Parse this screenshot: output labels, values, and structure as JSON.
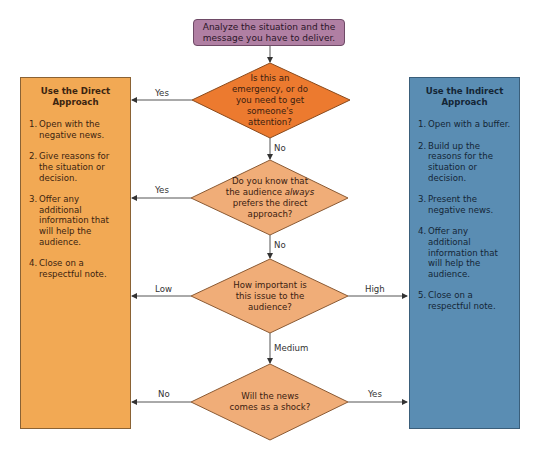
{
  "start": {
    "text": "Analyze the situation and the message you have to deliver."
  },
  "decisions": [
    {
      "id": "emergency",
      "lines": [
        "Is this an",
        "emergency, or do",
        "you need to get",
        "someone's",
        "attention?"
      ],
      "color": "#ec7a2f"
    },
    {
      "id": "always-direct",
      "lines_pre": "Do you know that",
      "line2_a": "the audience ",
      "line2_em": "always",
      "lines_post": [
        "prefers the direct",
        "approach?"
      ],
      "color": "#f0ad78"
    },
    {
      "id": "importance",
      "lines": [
        "How important is",
        "this issue to the",
        "audience?"
      ],
      "color": "#f0ad78"
    },
    {
      "id": "shock",
      "lines": [
        "Will the news",
        "comes as a shock?"
      ],
      "color": "#f0ad78"
    }
  ],
  "edges": {
    "d1_yes": "Yes",
    "d1_no": "No",
    "d2_yes": "Yes",
    "d2_no": "No",
    "d3_low": "Low",
    "d3_high": "High",
    "d3_medium": "Medium",
    "d4_no": "No",
    "d4_yes": "Yes"
  },
  "direct": {
    "title_l1": "Use the Direct",
    "title_l2": "Approach",
    "color": "#f2a954",
    "steps": [
      {
        "num": "1.",
        "text": "Open with the negative news."
      },
      {
        "num": "2.",
        "text": "Give reasons for the situation or decision."
      },
      {
        "num": "3.",
        "text": "Offer any additional information that will help the audience."
      },
      {
        "num": "4.",
        "text": "Close on a respectful note."
      }
    ]
  },
  "indirect": {
    "title_l1": "Use the Indirect",
    "title_l2": "Approach",
    "color": "#5a8db3",
    "steps": [
      {
        "num": "1.",
        "text": "Open with a buffer."
      },
      {
        "num": "2.",
        "text": "Build up the reasons for the situation or decision."
      },
      {
        "num": "3.",
        "text": "Present the negative news."
      },
      {
        "num": "4.",
        "text": "Offer any additional information that will help the audience."
      },
      {
        "num": "5.",
        "text": "Close on a respectful note."
      }
    ]
  }
}
